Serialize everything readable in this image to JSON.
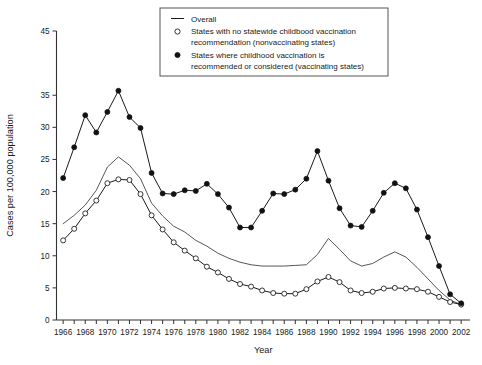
{
  "chart_data": {
    "type": "line",
    "title": "",
    "xlabel": "Year",
    "ylabel": "Cases per 100,000 population",
    "xlim": [
      1965.4,
      2002.8
    ],
    "ylim": [
      0,
      45
    ],
    "grid": false,
    "legend_position": "top-center",
    "y_ticks": [
      0,
      5,
      10,
      15,
      20,
      25,
      30,
      35,
      45
    ],
    "y_ticklabels": [
      "0",
      "5",
      "10",
      "15",
      "20",
      "25",
      "30",
      "35",
      "45"
    ],
    "x_ticks": [
      1966,
      1967,
      1968,
      1969,
      1970,
      1971,
      1972,
      1973,
      1974,
      1975,
      1976,
      1977,
      1978,
      1979,
      1980,
      1981,
      1982,
      1983,
      1984,
      1985,
      1986,
      1987,
      1988,
      1989,
      1990,
      1991,
      1992,
      1993,
      1994,
      1995,
      1996,
      1997,
      1998,
      1999,
      2000,
      2001,
      2002
    ],
    "x_ticklabels": [
      "1966",
      "",
      "1968",
      "",
      "1970",
      "",
      "1972",
      "",
      "1974",
      "",
      "1976",
      "",
      "1978",
      "",
      "1980",
      "",
      "1982",
      "",
      "1984",
      "",
      "1986",
      "",
      "1988",
      "",
      "1990",
      "",
      "1992",
      "",
      "1994",
      "",
      "1996",
      "",
      "1998",
      "",
      "2000",
      "",
      "2002"
    ],
    "x": [
      1966,
      1967,
      1968,
      1969,
      1970,
      1971,
      1972,
      1973,
      1974,
      1975,
      1976,
      1977,
      1978,
      1979,
      1980,
      1981,
      1982,
      1983,
      1984,
      1985,
      1986,
      1987,
      1988,
      1989,
      1990,
      1991,
      1992,
      1993,
      1994,
      1995,
      1996,
      1997,
      1998,
      1999,
      2000,
      2001,
      2002
    ],
    "series": [
      {
        "name": "Overall",
        "marker": "none",
        "values": [
          15.0,
          16.3,
          17.9,
          20.2,
          23.8,
          25.4,
          24.1,
          22.0,
          18.2,
          16.2,
          14.6,
          13.7,
          12.4,
          11.5,
          10.4,
          9.6,
          9.0,
          8.6,
          8.4,
          8.4,
          8.4,
          8.5,
          8.6,
          10.2,
          12.7,
          11.0,
          9.2,
          8.4,
          8.8,
          9.8,
          10.6,
          9.8,
          8.2,
          6.4,
          4.6,
          3.1,
          2.4
        ]
      },
      {
        "name": "States with no statewide childhood vaccination recommendation (nonvaccinating states)",
        "marker": "open-circle",
        "values": [
          12.4,
          14.2,
          16.6,
          18.6,
          21.3,
          21.9,
          21.8,
          19.6,
          16.3,
          14.1,
          12.1,
          10.8,
          9.6,
          8.3,
          7.4,
          6.4,
          5.6,
          5.2,
          4.6,
          4.2,
          4.1,
          4.1,
          4.8,
          6.0,
          6.7,
          5.9,
          4.6,
          4.2,
          4.4,
          4.9,
          5.0,
          4.9,
          4.8,
          4.4,
          3.6,
          2.8,
          2.4
        ]
      },
      {
        "name": "States where childhood vaccination is recommended or considered (vaccinating states)",
        "marker": "filled-circle",
        "values": [
          22.1,
          26.9,
          31.9,
          29.2,
          32.4,
          35.7,
          31.6,
          29.9,
          22.9,
          19.7,
          19.6,
          20.2,
          20.1,
          21.2,
          19.6,
          17.5,
          14.4,
          14.4,
          17.0,
          19.7,
          19.6,
          20.3,
          22.0,
          26.3,
          21.7,
          17.4,
          14.7,
          14.5,
          17.0,
          19.8,
          21.3,
          20.5,
          17.2,
          12.9,
          8.4,
          4.0,
          2.6
        ]
      }
    ]
  },
  "legend": {
    "entries": [
      {
        "key": "line",
        "label": "Overall"
      },
      {
        "key": "open-circle",
        "line1": "States with no statewide childbood vaccination",
        "line2": "recommendation (nonvaccinating states)"
      },
      {
        "key": "filled-circle",
        "line1": "States where childhood vaccination is",
        "line2": "recommended or considered (vaccinating states)"
      }
    ]
  },
  "colors": {
    "axis": "#333333",
    "line": "#1a1a1a",
    "marker_fill": "#111111",
    "marker_open_fill": "#ffffff",
    "background": "#ffffff"
  }
}
